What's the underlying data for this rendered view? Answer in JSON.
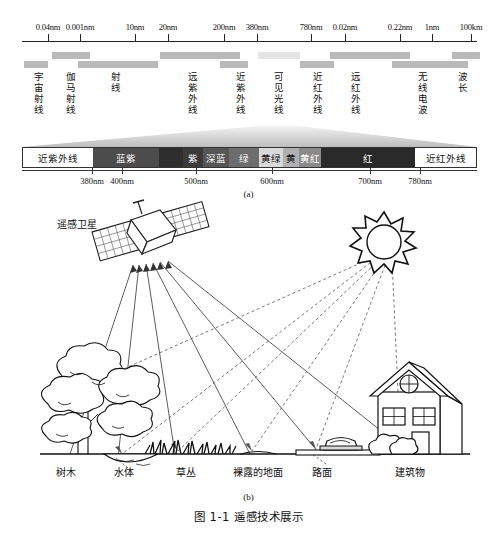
{
  "figure": {
    "caption": "图 1-1  遥感技术展示",
    "sub_a": "(a)",
    "sub_b": "(b)"
  },
  "panel_a": {
    "scale_ticks": [
      {
        "label": "0.04nm",
        "x": 48
      },
      {
        "label": "0.001nm",
        "x": 80
      },
      {
        "label": "10nm",
        "x": 135
      },
      {
        "label": "20nm",
        "x": 168
      },
      {
        "label": "200nm",
        "x": 224
      },
      {
        "label": "380nm",
        "x": 257
      },
      {
        "label": "780nm",
        "x": 311
      },
      {
        "label": "0.02nm",
        "x": 345
      },
      {
        "label": "0.22nm",
        "x": 400
      },
      {
        "label": "1nm",
        "x": 432
      },
      {
        "label": "100km",
        "x": 471
      }
    ],
    "bands": [
      {
        "name": "宇宙射线",
        "x": 38,
        "bar_x": 24,
        "bar_w": 24,
        "row": 2
      },
      {
        "name": "伽马射线",
        "x": 70,
        "bar_x": 52,
        "bar_w": 38,
        "row": 1
      },
      {
        "name": "射线",
        "x": 115,
        "bar_x": 78,
        "bar_w": 80,
        "row": 2
      },
      {
        "name": "远紫外线",
        "x": 192,
        "bar_x": 160,
        "bar_w": 80,
        "row": 1
      },
      {
        "name": "近紫外线",
        "x": 240,
        "bar_x": 220,
        "bar_w": 28,
        "row": 2
      },
      {
        "name": "可见光线",
        "x": 278,
        "bar_x": 258,
        "bar_w": 42,
        "row": 1,
        "light": true
      },
      {
        "name": "近红外线",
        "x": 317,
        "bar_x": 300,
        "bar_w": 34,
        "row": 2
      },
      {
        "name": "远红外线",
        "x": 355,
        "bar_x": 330,
        "bar_w": 80,
        "row": 1
      },
      {
        "name": "无线电波",
        "x": 422,
        "bar_x": 392,
        "bar_w": 76,
        "row": 2
      },
      {
        "name": "波长",
        "x": 462,
        "bar_x": 452,
        "bar_w": 28,
        "row": 1
      }
    ],
    "spectrum": {
      "segments": [
        {
          "label": "近紫外线",
          "color": "#ffffff",
          "width": 70,
          "dark": true
        },
        {
          "label": "蓝紫",
          "color": "#4c4c4c",
          "width": 66
        },
        {
          "label": "",
          "color": "#2e2e2e",
          "width": 24
        },
        {
          "label": "紫",
          "color": "#3a3a3a",
          "width": 20
        },
        {
          "label": "深蓝",
          "color": "#565656",
          "width": 26
        },
        {
          "label": "绿",
          "color": "#6d6d6d",
          "width": 30
        },
        {
          "label": "黄绿",
          "color": "#d9d9d9",
          "width": 24,
          "dark": true
        },
        {
          "label": "黄",
          "color": "#b0b0b0",
          "width": 16,
          "dark": true
        },
        {
          "label": "黄红",
          "color": "#8a8a8a",
          "width": 22
        },
        {
          "label": "红",
          "color": "#2a2a2a",
          "width": 94
        },
        {
          "label": "近红外线",
          "color": "#ffffff",
          "width": 61,
          "dark": true
        }
      ],
      "ticks": [
        {
          "label": "380nm",
          "x": 92
        },
        {
          "label": "400nm",
          "x": 122
        },
        {
          "label": "500nm",
          "x": 196
        },
        {
          "label": "600nm",
          "x": 272
        },
        {
          "label": "700nm",
          "x": 370
        },
        {
          "label": "780nm",
          "x": 420
        }
      ]
    }
  },
  "panel_b": {
    "satellite_label": "遥感卫星",
    "ground_labels": [
      {
        "name": "树木",
        "x": 66
      },
      {
        "name": "水体",
        "x": 124
      },
      {
        "name": "草丛",
        "x": 186
      },
      {
        "name": "裸露的地面",
        "x": 258
      },
      {
        "name": "路面",
        "x": 322
      },
      {
        "name": "建筑物",
        "x": 410
      }
    ]
  }
}
